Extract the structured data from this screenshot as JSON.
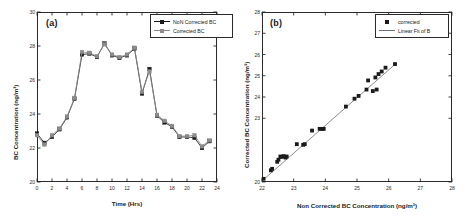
{
  "figure": {
    "panel_a_label": "(a)",
    "panel_b_label": "(b)"
  },
  "colors": {
    "series_non_corrected": "#1a1a1a",
    "series_corrected": "#8c8c8c",
    "scatter": "#1a1a1a",
    "fit_line": "#6e6e6e",
    "axis": "#2a2a2a"
  },
  "panel_a": {
    "legend": [
      {
        "label": "NoN Corrected BC",
        "key": "line-square-marker-dark"
      },
      {
        "label": "Corrected BC",
        "key": "line-square-marker-gray"
      }
    ],
    "x_title": "Time (Hrs)",
    "y_title": "BC Concentration (ng/m³)",
    "x_ticks": [
      "0",
      "2",
      "4",
      "6",
      "8",
      "10",
      "12",
      "14",
      "16",
      "18",
      "20",
      "22",
      "24"
    ],
    "y_ticks": [
      "20",
      "22",
      "24",
      "26",
      "28",
      "30"
    ]
  },
  "panel_b": {
    "legend": [
      {
        "label": "corrected",
        "key": "square-marker"
      },
      {
        "label": "Linear Fit of B",
        "key": "line"
      }
    ],
    "x_title": "Non Corrected BC Concentration (ng/m³)",
    "y_title": "Corrected BC Concentration (ng/m³)",
    "x_ticks": [
      "22",
      "23",
      "24",
      "25",
      "26",
      "27",
      "28"
    ],
    "y_ticks": [
      "20",
      "23",
      "24",
      "25",
      "26",
      "27",
      "28"
    ]
  },
  "chart_data": [
    {
      "type": "line",
      "panel": "(a)",
      "title": "",
      "xlabel": "Time (Hrs)",
      "ylabel": "BC Concentration (ng/m³)",
      "xlim": [
        0,
        24
      ],
      "ylim": [
        20,
        30
      ],
      "xticks": [
        0,
        2,
        4,
        6,
        8,
        10,
        12,
        14,
        16,
        18,
        20,
        22,
        24
      ],
      "yticks": [
        20,
        22,
        24,
        26,
        28,
        30
      ],
      "grid": false,
      "legend_position": "upper right",
      "x": [
        0,
        1,
        2,
        3,
        4,
        5,
        6,
        7,
        8,
        9,
        10,
        11,
        12,
        13,
        14,
        15,
        16,
        17,
        18,
        19,
        20,
        21,
        22,
        23
      ],
      "series": [
        {
          "name": "NoN Corrected BC",
          "marker": "square",
          "color": "#1a1a1a",
          "values": [
            22.85,
            22.3,
            22.65,
            23.1,
            23.8,
            24.9,
            27.5,
            27.55,
            27.35,
            28.15,
            27.45,
            27.3,
            27.45,
            27.85,
            25.2,
            26.65,
            23.9,
            23.5,
            23.25,
            22.65,
            22.65,
            22.6,
            22.0,
            22.4
          ]
        },
        {
          "name": "Corrected BC",
          "marker": "square",
          "color": "#8c8c8c",
          "values": [
            22.75,
            22.2,
            22.75,
            23.15,
            23.85,
            24.95,
            27.65,
            27.6,
            27.4,
            28.1,
            27.5,
            27.35,
            27.5,
            27.9,
            25.3,
            26.5,
            23.95,
            23.6,
            23.3,
            22.7,
            22.7,
            22.75,
            22.1,
            22.45
          ]
        }
      ]
    },
    {
      "type": "scatter",
      "panel": "(b)",
      "title": "",
      "xlabel": "Non Corrected BC Concentration (ng/m³)",
      "ylabel": "Corrected BC Concentration (ng/m³)",
      "xlim": [
        22,
        28
      ],
      "ylim": [
        20,
        28
      ],
      "xticks": [
        22,
        23,
        24,
        25,
        26,
        27,
        28
      ],
      "yticks": [
        20,
        23,
        24,
        25,
        26,
        27,
        28
      ],
      "grid": false,
      "legend_position": "upper right",
      "series": [
        {
          "name": "corrected",
          "marker": "square",
          "color": "#1a1a1a",
          "points": [
            [
              22.05,
              20.15
            ],
            [
              22.28,
              20.55
            ],
            [
              22.32,
              20.62
            ],
            [
              22.48,
              20.95
            ],
            [
              22.52,
              21.05
            ],
            [
              22.58,
              21.2
            ],
            [
              22.62,
              21.18
            ],
            [
              22.68,
              21.22
            ],
            [
              22.74,
              21.15
            ],
            [
              22.78,
              21.2
            ],
            [
              23.1,
              21.78
            ],
            [
              23.3,
              21.75
            ],
            [
              23.35,
              21.78
            ],
            [
              23.58,
              22.42
            ],
            [
              23.82,
              22.5
            ],
            [
              23.9,
              22.5
            ],
            [
              23.95,
              22.5
            ],
            [
              24.65,
              23.55
            ],
            [
              24.92,
              23.92
            ],
            [
              25.05,
              24.05
            ],
            [
              25.3,
              24.35
            ],
            [
              25.35,
              24.78
            ],
            [
              25.5,
              24.28
            ],
            [
              25.58,
              24.92
            ],
            [
              25.62,
              24.35
            ],
            [
              25.68,
              25.08
            ],
            [
              25.78,
              25.2
            ],
            [
              25.9,
              25.38
            ],
            [
              26.2,
              25.55
            ]
          ]
        },
        {
          "name": "Linear Fit of B",
          "type": "line",
          "color": "#6e6e6e",
          "endpoints": [
            [
              22.0,
              20.05
            ],
            [
              26.25,
              25.6
            ]
          ]
        }
      ]
    }
  ]
}
